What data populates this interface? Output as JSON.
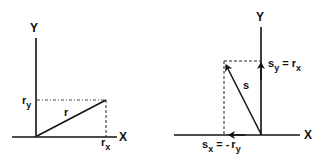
{
  "left_diagram": {
    "y_axis_label": "Y",
    "x_axis_label": "X",
    "vector_label": "r",
    "y_component_label": {
      "base": "r",
      "sub": "y"
    },
    "x_component_label": {
      "base": "r",
      "sub": "x"
    }
  },
  "right_diagram": {
    "y_axis_label": "Y",
    "x_axis_label": "X",
    "vector_label": "s",
    "y_component_label": {
      "base": "s",
      "sub": "y",
      "eq": " = ",
      "rhs_base": "r",
      "rhs_sub": "x"
    },
    "x_component_label": {
      "base": "s",
      "sub": "x",
      "eq": " = ",
      "neg": "-",
      "rhs_base": "r",
      "rhs_sub": "y"
    }
  },
  "colors": {
    "ink": "#111111",
    "background": "#ffffff"
  }
}
